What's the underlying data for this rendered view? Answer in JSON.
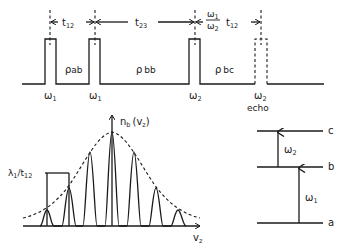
{
  "pulse_sequence": {
    "intervals": [
      {
        "id": "t12",
        "label": "t",
        "sub": "12"
      },
      {
        "id": "t23",
        "label": "t",
        "sub": "23"
      },
      {
        "id": "echo_delay",
        "ratio_num": "ω",
        "ratio_num_sub": "1",
        "ratio_den": "ω",
        "ratio_den_sub": "2",
        "label": "t",
        "sub": "12"
      }
    ],
    "pulses": [
      {
        "label": "ω",
        "sub": "1"
      },
      {
        "label": "ω",
        "sub": "1"
      },
      {
        "label": "ω",
        "sub": "2"
      },
      {
        "label": "ω",
        "sub": "2",
        "note": "echo"
      }
    ],
    "density_labels": [
      {
        "label": "ρ",
        "sub": "ab"
      },
      {
        "label": "ρ",
        "sub": "bb"
      },
      {
        "label": "ρ",
        "sub": "bc"
      }
    ]
  },
  "distribution_plot": {
    "y_label": "n",
    "y_label_sub": "b",
    "y_label_arg": "(v",
    "y_label_arg_sub": "z",
    "y_label_close": ")",
    "x_label": "v",
    "x_label_sub": "z",
    "period_label": "λ",
    "period_label_sub": "1",
    "period_label_div": "/t",
    "period_label_div_sub": "12",
    "envelope_style": "dashed gaussian",
    "fringe_count": 7
  },
  "level_diagram": {
    "levels": [
      {
        "name": "c"
      },
      {
        "name": "b"
      },
      {
        "name": "a"
      }
    ],
    "transitions": [
      {
        "from": "b",
        "to": "c",
        "label": "ω",
        "sub": "2"
      },
      {
        "from": "a",
        "to": "b",
        "label": "ω",
        "sub": "1"
      }
    ]
  }
}
